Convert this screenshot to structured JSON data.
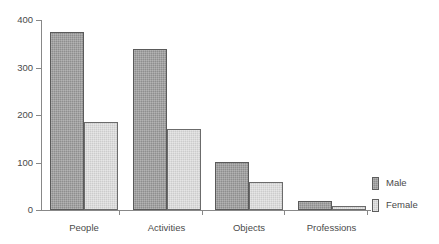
{
  "chart_data": {
    "type": "bar",
    "title": "",
    "subtitle": "",
    "xlabel": "",
    "ylabel": "",
    "categories": [
      "People",
      "Activities",
      "Objects",
      "Professions"
    ],
    "series": [
      {
        "name": "Male",
        "values": [
          374,
          339,
          101,
          19
        ],
        "color": "#8e8e8e"
      },
      {
        "name": "Female",
        "values": [
          185,
          170,
          60,
          8
        ],
        "color": "#cccccc"
      }
    ],
    "ylim": [
      0,
      400
    ],
    "yticks": [
      0,
      100,
      200,
      300,
      400
    ],
    "ytick_labels": [
      "0",
      "100",
      "200",
      "300",
      "400"
    ],
    "grid": false,
    "legend_position": "right",
    "legend_entries": [
      "Male",
      "Female"
    ],
    "bar_grouping": "adjacent",
    "axis_color": "#888888",
    "text_color": "#4a4a4a",
    "background": "#ffffff"
  }
}
